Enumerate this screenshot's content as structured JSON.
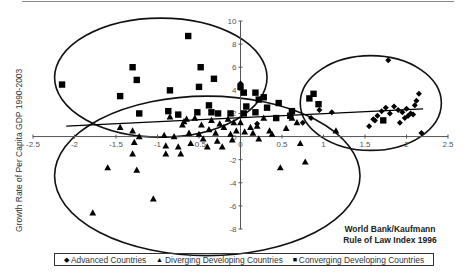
{
  "chart_data": {
    "type": "scatter",
    "title": "",
    "xlabel": "World Bank/Kaufmann Rule of Law Index 1996",
    "xlabel_lines": [
      "World Bank/Kaufmann",
      "Rule of Law Index 1996"
    ],
    "ylabel": "Growth Rate of Per Capita GDP 1990-2003",
    "xlim": [
      -2.5,
      2.5
    ],
    "ylim": [
      -8,
      10
    ],
    "x_ticks": [
      -2.5,
      -2,
      -1.5,
      -1,
      -0.5,
      0,
      0.5,
      1,
      1.5,
      2,
      2.5
    ],
    "x_tick_labels": [
      "-2.5",
      "-2",
      "-1.5",
      "-1",
      "-0.5",
      "0",
      "0.5",
      "1",
      "1.5",
      "2",
      "2.5"
    ],
    "y_ticks": [
      -8,
      -6,
      -4,
      -2,
      0,
      2,
      4,
      6,
      8,
      10
    ],
    "y_tick_labels": [
      "-8",
      "-6",
      "-4",
      "-2",
      "0",
      "2",
      "4",
      "6",
      "8",
      "10"
    ],
    "grid": false,
    "legend_position": "bottom",
    "series": [
      {
        "name": "Advanced Countries",
        "marker": "diamond",
        "points": [
          [
            0.0,
            4.6
          ],
          [
            0.2,
            1.1
          ],
          [
            0.75,
            1.2
          ],
          [
            0.95,
            2.3
          ],
          [
            1.1,
            2.1
          ],
          [
            0.85,
            1.6
          ],
          [
            1.55,
            0.9
          ],
          [
            1.6,
            1.5
          ],
          [
            1.65,
            1.8
          ],
          [
            1.7,
            2.2
          ],
          [
            1.75,
            2.5
          ],
          [
            1.8,
            2.0
          ],
          [
            1.85,
            2.6
          ],
          [
            1.9,
            2.3
          ],
          [
            1.92,
            1.2
          ],
          [
            1.95,
            2.1
          ],
          [
            1.98,
            1.6
          ],
          [
            2.02,
            1.8
          ],
          [
            2.05,
            2.0
          ],
          [
            2.08,
            1.9
          ],
          [
            2.1,
            2.7
          ],
          [
            2.12,
            3.1
          ],
          [
            2.15,
            3.7
          ],
          [
            2.18,
            0.3
          ],
          [
            1.78,
            6.6
          ],
          [
            1.62,
            1.4
          ],
          [
            2.0,
            2.4
          ]
        ]
      },
      {
        "name": "Diverging Developing Countries",
        "marker": "triangle",
        "points": [
          [
            -1.78,
            -6.6
          ],
          [
            -1.6,
            -2.7
          ],
          [
            -1.45,
            0.8
          ],
          [
            -1.3,
            0.5
          ],
          [
            -1.28,
            -0.5
          ],
          [
            -1.3,
            -1.5
          ],
          [
            -1.25,
            -2.9
          ],
          [
            -1.22,
            0.0
          ],
          [
            -1.05,
            -5.4
          ],
          [
            -0.92,
            0.1
          ],
          [
            -0.9,
            -0.8
          ],
          [
            -0.9,
            -1.5
          ],
          [
            -0.85,
            1.7
          ],
          [
            -0.8,
            0.0
          ],
          [
            -0.75,
            -0.9
          ],
          [
            -0.72,
            -1.5
          ],
          [
            -0.7,
            1.0
          ],
          [
            -0.68,
            1.3
          ],
          [
            -0.65,
            1.5
          ],
          [
            -0.62,
            0.3
          ],
          [
            -0.6,
            -0.6
          ],
          [
            -0.55,
            1.6
          ],
          [
            -0.5,
            0.2
          ],
          [
            -0.47,
            1.0
          ],
          [
            -0.45,
            -0.2
          ],
          [
            -0.4,
            -0.9
          ],
          [
            -0.38,
            0.6
          ],
          [
            -0.35,
            1.4
          ],
          [
            -0.3,
            0.3
          ],
          [
            -0.28,
            -0.4
          ],
          [
            -0.25,
            1.1
          ],
          [
            -0.22,
            -0.9
          ],
          [
            -0.2,
            0.8
          ],
          [
            -0.15,
            1.5
          ],
          [
            -0.12,
            0.2
          ],
          [
            -0.1,
            -0.3
          ],
          [
            -0.08,
            1.2
          ],
          [
            -0.05,
            0.5
          ],
          [
            0.0,
            1.2
          ],
          [
            0.05,
            0.4
          ],
          [
            0.12,
            0.8
          ],
          [
            0.15,
            0.3
          ],
          [
            0.2,
            0.9
          ],
          [
            0.22,
            -0.2
          ],
          [
            0.28,
            1.6
          ],
          [
            0.35,
            0.5
          ],
          [
            0.38,
            0.2
          ],
          [
            0.48,
            -2.7
          ],
          [
            0.55,
            0.7
          ],
          [
            0.62,
            1.6
          ],
          [
            0.72,
            -0.6
          ],
          [
            0.78,
            -2.2
          ],
          [
            1.15,
            0.5
          ],
          [
            0.68,
            1.2
          ]
        ]
      },
      {
        "name": "Converging Developing Countries",
        "marker": "square",
        "points": [
          [
            -2.15,
            4.5
          ],
          [
            -1.3,
            6.0
          ],
          [
            -1.25,
            4.9
          ],
          [
            -1.45,
            3.5
          ],
          [
            -0.85,
            4.0
          ],
          [
            -0.63,
            8.7
          ],
          [
            -0.48,
            6.0
          ],
          [
            -0.5,
            4.3
          ],
          [
            -0.32,
            5.0
          ],
          [
            -0.87,
            2.2
          ],
          [
            -0.75,
            1.9
          ],
          [
            -0.38,
            2.7
          ],
          [
            0.0,
            4.3
          ],
          [
            -1.22,
            2.0
          ],
          [
            -0.52,
            2.1
          ],
          [
            -0.35,
            2.1
          ],
          [
            -0.27,
            2.0
          ],
          [
            -0.12,
            2.0
          ],
          [
            0.04,
            2.0
          ],
          [
            0.18,
            3.8
          ],
          [
            0.28,
            3.4
          ],
          [
            0.46,
            2.9
          ],
          [
            0.43,
            1.6
          ],
          [
            0.07,
            2.6
          ],
          [
            0.22,
            3.2
          ],
          [
            0.32,
            2.5
          ],
          [
            0.6,
            1.8
          ],
          [
            0.62,
            2.2
          ],
          [
            0.94,
            2.8
          ],
          [
            0.83,
            3.3
          ],
          [
            0.88,
            3.7
          ],
          [
            0.18,
            2.1
          ],
          [
            0.04,
            3.8
          ],
          [
            1.72,
            1.4
          ]
        ]
      }
    ],
    "trend_line": {
      "from": [
        -2.1,
        0.9
      ],
      "to": [
        2.2,
        2.4
      ]
    },
    "ellipses": [
      {
        "group": "Converging Developing Countries",
        "center": [
          -0.96,
          5.1
        ],
        "radius_x": 1.28,
        "radius_y": 5.15
      },
      {
        "group": "Diverging Developing Countries",
        "center": [
          -0.4,
          -3.4
        ],
        "radius_x": 1.84,
        "radius_y": 6.9
      },
      {
        "group": "Advanced Countries",
        "center": [
          1.57,
          2.9
        ],
        "radius_x": 0.85,
        "radius_y": 4.1
      }
    ]
  },
  "legend": {
    "items": [
      {
        "symbol": "◆",
        "label": "Advanced Countries"
      },
      {
        "symbol": "▲",
        "label": "Diverging Developing Countries"
      },
      {
        "symbol": "■",
        "label": "Converging Developing Countries"
      }
    ]
  }
}
